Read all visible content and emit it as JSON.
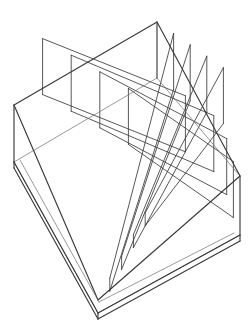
{
  "figure": {
    "name": "perspective-wireframe-tray",
    "background_color": "#ffffff",
    "line_color": "#3a3a3a",
    "line_color_light": "#6f6f6f",
    "line_width_outline": 1.15,
    "line_width_inner": 0.85,
    "canvas": {
      "width": 252,
      "height": 322
    }
  },
  "geometry": {
    "note": "Corner keys for the tray rim (top opening plane) and base plane, in canvas pixel coordinates",
    "rim": {
      "back_apex": [
        157,
        22
      ],
      "left_corner": [
        14,
        105
      ],
      "right_corner": [
        240,
        176
      ],
      "front_apex": [
        98,
        300
      ]
    },
    "base": {
      "back_apex": [
        157,
        78
      ],
      "left_corner": [
        14,
        162
      ],
      "right_corner": [
        240,
        235
      ],
      "front_apex": [
        98,
        313
      ]
    },
    "wall_height_px": 57,
    "base_slab_thickness_px": 6,
    "divider_counts": {
      "along_left_edge": 4,
      "along_right_edge": 4
    },
    "compartments_total": 25
  },
  "caption": {
    "clipped_line": "· ·    ·· ·      ·       ·· ·             ·        ··      ·",
    "visible": true
  }
}
